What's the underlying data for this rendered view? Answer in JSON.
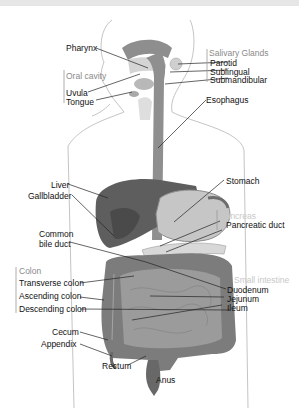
{
  "title_bar": "",
  "diagram": {
    "topic": "Human digestive system",
    "colors": {
      "organ_dark": "#6f6f6f",
      "organ_mid": "#8c8c8c",
      "organ_light": "#bdbdbd",
      "liver": "#5a5a5a",
      "outline": "#b0b0b0",
      "leader_line": "#222222",
      "group_label": "#8a8a8a",
      "faint_label": "#c8c8c8"
    },
    "groups": {
      "salivary": "Salivary Glands",
      "oral": "Oral cavity",
      "pancreas": "Pancreas",
      "colon": "Colon",
      "small_intestine": "Small intestine"
    },
    "labels": {
      "pharynx": "Pharynx",
      "parotid": "Parotid",
      "sublingual": "Sublingual",
      "submandibular": "Submandibular",
      "uvula": "Uvula",
      "tongue": "Tongue",
      "esophagus": "Esophagus",
      "liver": "Liver",
      "gallbladder": "Gallbladder",
      "stomach": "Stomach",
      "common_bile_duct_1": "Common",
      "common_bile_duct_2": "bile duct",
      "pancreatic_duct": "Pancreatic duct",
      "transverse_colon": "Transverse colon",
      "ascending_colon": "Ascending colon",
      "descending_colon": "Descending colon",
      "duodenum": "Duodenum",
      "jejunum": "Jejunum",
      "ileum": "Ileum",
      "cecum": "Cecum",
      "appendix": "Appendix",
      "rectum": "Rectum",
      "anus": "Anus"
    }
  }
}
